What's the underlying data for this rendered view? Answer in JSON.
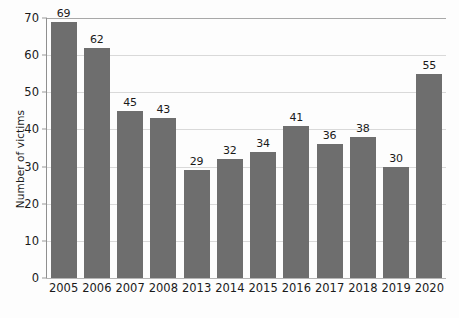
{
  "chart_data": {
    "type": "bar",
    "title": "",
    "subtitle": "",
    "xlabel": "",
    "ylabel": "Number of victims",
    "categories": [
      "2005",
      "2006",
      "2007",
      "2008",
      "2013",
      "2014",
      "2015",
      "2016",
      "2017",
      "2018",
      "2019",
      "2020"
    ],
    "values": [
      69,
      62,
      45,
      43,
      29,
      32,
      34,
      41,
      36,
      38,
      30,
      55
    ],
    "ylim": [
      0,
      70
    ],
    "y_ticks": [
      0,
      10,
      20,
      30,
      40,
      50,
      60,
      70
    ],
    "y_tick_labels": [
      "0",
      "10",
      "20",
      "30",
      "40",
      "50",
      "60",
      "70"
    ],
    "data_labels": [
      "69",
      "62",
      "45",
      "43",
      "29",
      "32",
      "34",
      "41",
      "36",
      "38",
      "30",
      "55"
    ],
    "grid": true,
    "grid_axis": "y",
    "legend": false,
    "legend_position": "none",
    "bar_color": "#6e6e6e",
    "grid_color": "#d9d9d9",
    "axis_color": "#8f8f8f",
    "text_color": "#1a1a1a",
    "background_color": "#fdfdfd"
  }
}
